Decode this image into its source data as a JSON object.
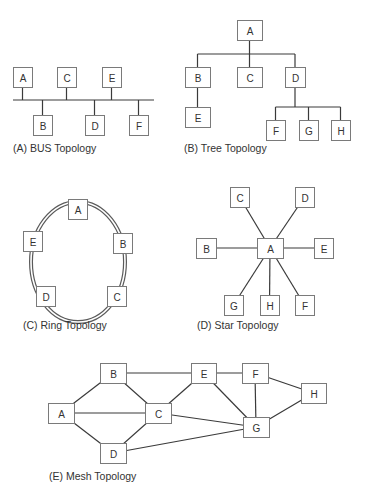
{
  "colors": {
    "node_stroke": "#7a7a7a",
    "edge": "#3a3a3a",
    "text": "#333333",
    "background": "#ffffff"
  },
  "diagrams": {
    "bus": {
      "caption": "(A) BUS Topology",
      "bus_line": {
        "x1": 13,
        "x2": 154,
        "y": 100
      },
      "nodes": [
        {
          "id": "A",
          "label": "A",
          "x": 13,
          "y": 67,
          "w": 19,
          "h": 20,
          "side": "top"
        },
        {
          "id": "C",
          "label": "C",
          "x": 57,
          "y": 67,
          "w": 19,
          "h": 20,
          "side": "top"
        },
        {
          "id": "E",
          "label": "E",
          "x": 102,
          "y": 67,
          "w": 19,
          "h": 20,
          "side": "top"
        },
        {
          "id": "B",
          "label": "B",
          "x": 33,
          "y": 115,
          "w": 19,
          "h": 20,
          "side": "bottom"
        },
        {
          "id": "D",
          "label": "D",
          "x": 85,
          "y": 115,
          "w": 19,
          "h": 20,
          "side": "bottom"
        },
        {
          "id": "F",
          "label": "F",
          "x": 129,
          "y": 115,
          "w": 19,
          "h": 20,
          "side": "bottom"
        }
      ]
    },
    "tree": {
      "caption": "(B) Tree Topology",
      "nodes": [
        {
          "id": "A",
          "label": "A",
          "x": 237,
          "y": 20,
          "w": 25,
          "h": 20
        },
        {
          "id": "B",
          "label": "B",
          "x": 185,
          "y": 67,
          "w": 25,
          "h": 20
        },
        {
          "id": "C",
          "label": "C",
          "x": 237,
          "y": 67,
          "w": 25,
          "h": 20
        },
        {
          "id": "D",
          "label": "D",
          "x": 285,
          "y": 67,
          "w": 20,
          "h": 20
        },
        {
          "id": "E",
          "label": "E",
          "x": 185,
          "y": 107,
          "w": 25,
          "h": 20
        },
        {
          "id": "F",
          "label": "F",
          "x": 266,
          "y": 120,
          "w": 19,
          "h": 20
        },
        {
          "id": "G",
          "label": "G",
          "x": 299,
          "y": 120,
          "w": 19,
          "h": 20
        },
        {
          "id": "H",
          "label": "H",
          "x": 331,
          "y": 120,
          "w": 19,
          "h": 20
        }
      ],
      "edges": [
        [
          "A",
          "B"
        ],
        [
          "A",
          "C"
        ],
        [
          "A",
          "D"
        ],
        [
          "B",
          "E"
        ],
        [
          "D",
          "F"
        ],
        [
          "D",
          "G"
        ],
        [
          "D",
          "H"
        ]
      ]
    },
    "ring": {
      "caption": "(C) Ring Topology",
      "ellipse": {
        "cx": 78,
        "cy": 262,
        "rx": 47,
        "ry": 60
      },
      "nodes": [
        {
          "id": "A",
          "label": "A",
          "x": 68,
          "y": 199,
          "w": 19,
          "h": 20
        },
        {
          "id": "B",
          "label": "B",
          "x": 113,
          "y": 233,
          "w": 19,
          "h": 20
        },
        {
          "id": "C",
          "label": "C",
          "x": 107,
          "y": 286,
          "w": 19,
          "h": 20
        },
        {
          "id": "D",
          "label": "D",
          "x": 36,
          "y": 286,
          "w": 19,
          "h": 20
        },
        {
          "id": "E",
          "label": "E",
          "x": 23,
          "y": 231,
          "w": 19,
          "h": 20
        }
      ]
    },
    "star": {
      "caption": "(D) Star Topology",
      "hub": "A",
      "nodes": [
        {
          "id": "A",
          "label": "A",
          "x": 257,
          "y": 238,
          "w": 26,
          "h": 20
        },
        {
          "id": "B",
          "label": "B",
          "x": 196,
          "y": 238,
          "w": 20,
          "h": 20
        },
        {
          "id": "C",
          "label": "C",
          "x": 230,
          "y": 187,
          "w": 19,
          "h": 20
        },
        {
          "id": "D",
          "label": "D",
          "x": 295,
          "y": 187,
          "w": 19,
          "h": 20
        },
        {
          "id": "E",
          "label": "E",
          "x": 314,
          "y": 238,
          "w": 19,
          "h": 20
        },
        {
          "id": "F",
          "label": "F",
          "x": 295,
          "y": 295,
          "w": 19,
          "h": 20
        },
        {
          "id": "G",
          "label": "G",
          "x": 224,
          "y": 295,
          "w": 19,
          "h": 20
        },
        {
          "id": "H",
          "label": "H",
          "x": 260,
          "y": 295,
          "w": 19,
          "h": 20
        }
      ],
      "edges": [
        [
          "A",
          "B"
        ],
        [
          "A",
          "C"
        ],
        [
          "A",
          "D"
        ],
        [
          "A",
          "E"
        ],
        [
          "A",
          "F"
        ],
        [
          "A",
          "G"
        ],
        [
          "A",
          "H"
        ]
      ]
    },
    "mesh": {
      "caption": "(E) Mesh Topology",
      "nodes": [
        {
          "id": "A",
          "label": "A",
          "x": 48,
          "y": 403,
          "w": 26,
          "h": 20
        },
        {
          "id": "B",
          "label": "B",
          "x": 100,
          "y": 363,
          "w": 26,
          "h": 20
        },
        {
          "id": "C",
          "label": "C",
          "x": 145,
          "y": 403,
          "w": 26,
          "h": 20
        },
        {
          "id": "D",
          "label": "D",
          "x": 100,
          "y": 443,
          "w": 26,
          "h": 20
        },
        {
          "id": "E",
          "label": "E",
          "x": 191,
          "y": 363,
          "w": 25,
          "h": 20
        },
        {
          "id": "F",
          "label": "F",
          "x": 242,
          "y": 363,
          "w": 26,
          "h": 20
        },
        {
          "id": "G",
          "label": "G",
          "x": 243,
          "y": 417,
          "w": 26,
          "h": 20
        },
        {
          "id": "H",
          "label": "H",
          "x": 301,
          "y": 383,
          "w": 25,
          "h": 20
        }
      ],
      "edges": [
        [
          "A",
          "B"
        ],
        [
          "A",
          "C"
        ],
        [
          "A",
          "D"
        ],
        [
          "B",
          "C"
        ],
        [
          "B",
          "E"
        ],
        [
          "C",
          "D"
        ],
        [
          "C",
          "E"
        ],
        [
          "C",
          "G"
        ],
        [
          "D",
          "G"
        ],
        [
          "E",
          "F"
        ],
        [
          "E",
          "G"
        ],
        [
          "F",
          "G"
        ],
        [
          "F",
          "H"
        ],
        [
          "G",
          "H"
        ]
      ]
    }
  }
}
